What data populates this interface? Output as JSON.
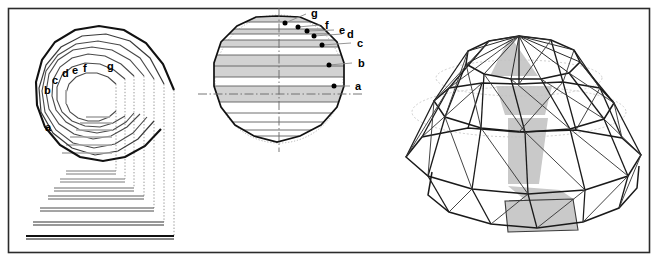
{
  "figure": {
    "background_color": "#ffffff",
    "border_color": "#2b2b2b",
    "frame": {
      "x": 8,
      "y": 8,
      "width": 642,
      "height": 245
    }
  },
  "style": {
    "line_dark": "#1a1a1a",
    "line_medium": "#555555",
    "line_light": "#8f8f8f",
    "band_fill": "#d2d2d2",
    "panel_fill": "#c9c9c9",
    "dot_color": "#000000"
  },
  "panels": [
    {
      "id": "plan-view",
      "name": "Plan view with concentric rings",
      "ring_labels": [
        "a",
        "b",
        "c",
        "d",
        "e",
        "f",
        "g"
      ]
    },
    {
      "id": "elevation-view",
      "name": "Elevation section with latitude bands",
      "point_labels": [
        "a",
        "b",
        "c",
        "d",
        "e",
        "f",
        "g"
      ]
    },
    {
      "id": "perspective-view",
      "name": "Perspective view of assembled dome"
    }
  ],
  "plan_view": {
    "labels": [
      {
        "text": "a",
        "x": 45,
        "y": 131
      },
      {
        "text": "b",
        "x": 44,
        "y": 94
      },
      {
        "text": "c",
        "x": 52,
        "y": 84
      },
      {
        "text": "d",
        "x": 62,
        "y": 77
      },
      {
        "text": "e",
        "x": 72,
        "y": 74
      },
      {
        "text": "f",
        "x": 83,
        "y": 72
      },
      {
        "text": "g",
        "x": 107,
        "y": 70
      }
    ],
    "ring_count": 7,
    "unrolled_strip_count": 6
  },
  "elevation_view": {
    "labels": [
      {
        "text": "a",
        "x": 355,
        "y": 90
      },
      {
        "text": "b",
        "x": 358,
        "y": 67
      },
      {
        "text": "c",
        "x": 357,
        "y": 47
      },
      {
        "text": "d",
        "x": 347,
        "y": 38
      },
      {
        "text": "e",
        "x": 339,
        "y": 34
      },
      {
        "text": "f",
        "x": 325,
        "y": 29
      },
      {
        "text": "g",
        "x": 313,
        "y": 17
      }
    ],
    "points": [
      {
        "label": "a",
        "x": 334,
        "y": 86
      },
      {
        "label": "b",
        "x": 329,
        "y": 65
      },
      {
        "label": "c",
        "x": 322,
        "y": 45
      },
      {
        "label": "d",
        "x": 314,
        "y": 36
      },
      {
        "label": "e",
        "x": 307,
        "y": 31
      },
      {
        "label": "f",
        "x": 298,
        "y": 27
      },
      {
        "label": "g",
        "x": 285,
        "y": 23
      }
    ],
    "band_count": 14,
    "has_vertical_centerline": true,
    "has_horizontal_centerline": true,
    "has_dotted_circle": true
  },
  "perspective_view": {
    "shaded_gore_panels": 4,
    "base_panel_shaded": true
  }
}
